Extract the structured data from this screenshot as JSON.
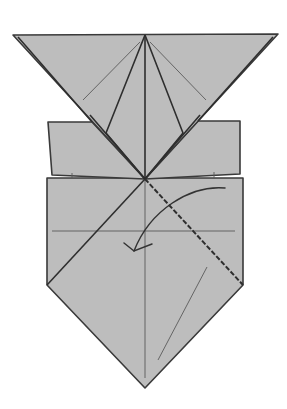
{
  "diagram": {
    "colors": {
      "paper": "#bdbdbd",
      "line": "#2e2e2e",
      "background": "#ffffff"
    },
    "elements": {
      "top_triangle": "Inverted top triangle flap",
      "side_flaps": "Left and right rectangular flaps",
      "body": "Lower pentagon body",
      "valley_fold": "Diagonal valley fold line (right)",
      "fold_arrow": "Curved arrow indicating fold toward lower-left"
    }
  }
}
